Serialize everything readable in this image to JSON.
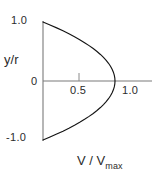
{
  "chart_data": {
    "type": "line",
    "title": "",
    "subtitle": "",
    "xlabel": "V / Vmax",
    "xlabel_base": "V / V",
    "xlabel_sub": "max",
    "ylabel": "y/r",
    "ylabel_numerator": "y",
    "ylabel_denominator": "r",
    "xlim": [
      0,
      1.28
    ],
    "ylim": [
      -1.18,
      1.18
    ],
    "grid": false,
    "legend": false,
    "x_ticks": [
      0.5,
      1.0
    ],
    "x_tick_labels": [
      "0.5",
      "1.0"
    ],
    "y_ticks": [
      1.0,
      0,
      -1.0
    ],
    "y_tick_labels": [
      "1.0",
      "0",
      "-1.0"
    ],
    "series": [
      {
        "name": "parabolic velocity profile",
        "equation": "V/Vmax = 1 - (y/r)^2",
        "x": [
          0.0,
          0.0975,
          0.19,
          0.2775,
          0.36,
          0.4375,
          0.51,
          0.5775,
          0.64,
          0.6975,
          0.75,
          0.7975,
          0.84,
          0.8775,
          0.91,
          0.9375,
          0.96,
          0.9775,
          0.99,
          0.9975,
          1.0,
          0.9975,
          0.99,
          0.9775,
          0.96,
          0.9375,
          0.91,
          0.8775,
          0.84,
          0.7975,
          0.75,
          0.6975,
          0.64,
          0.5775,
          0.51,
          0.4375,
          0.36,
          0.2775,
          0.19,
          0.0975,
          0.0
        ],
        "y": [
          1.0,
          0.95,
          0.9,
          0.85,
          0.8,
          0.75,
          0.7,
          0.65,
          0.6,
          0.55,
          0.5,
          0.45,
          0.4,
          0.35,
          0.3,
          0.25,
          0.2,
          0.15,
          0.1,
          0.05,
          0.0,
          -0.05,
          -0.1,
          -0.15,
          -0.2,
          -0.25,
          -0.3,
          -0.35,
          -0.4,
          -0.45,
          -0.5,
          -0.55,
          -0.6,
          -0.65,
          -0.7,
          -0.75,
          -0.8,
          -0.85,
          -0.9,
          -0.95,
          -1.0
        ],
        "color": "#000000"
      }
    ],
    "axis_color": "#6b6b6b",
    "curve_color": "#111111",
    "background": "#ffffff"
  },
  "axes": {
    "y_axis_title": "y/r",
    "x_axis_title": "V / Vmax"
  },
  "ticks": {
    "y_top": "1.0",
    "y_zero": "0",
    "y_bottom": "-1.0",
    "x_half": "0.5",
    "x_one": "1.0"
  },
  "labels": {
    "x_title_base": "V / V",
    "x_title_sub": "max",
    "y_title_num": "y",
    "y_title_slash": "/",
    "y_title_den": "r"
  }
}
